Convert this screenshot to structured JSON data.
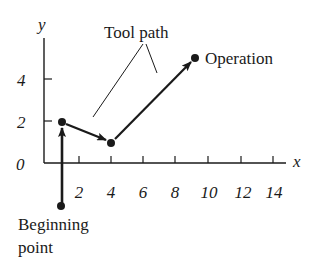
{
  "diagram": {
    "type": "coordinate-plot",
    "axes": {
      "x_label": "x",
      "y_label": "y",
      "origin_label": "0",
      "x_ticks": [
        "2",
        "4",
        "6",
        "8",
        "10",
        "12",
        "14"
      ],
      "y_ticks": [
        "2",
        "4"
      ]
    },
    "annotations": {
      "tool_path": "Tool path",
      "operation": "Operation",
      "beginning_line1": "Beginning",
      "beginning_line2": "point"
    },
    "points": [
      {
        "name": "beginning-point",
        "x": 1,
        "y": -2
      },
      {
        "name": "waypoint-1",
        "x": 1,
        "y": 2
      },
      {
        "name": "waypoint-2",
        "x": 4,
        "y": 1
      },
      {
        "name": "operation-point",
        "x": 9.25,
        "y": 5
      }
    ],
    "colors": {
      "ink": "#1a1a1a",
      "background": "#ffffff"
    }
  }
}
